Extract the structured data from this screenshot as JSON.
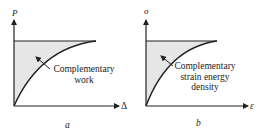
{
  "panels": [
    {
      "id": "a",
      "caption": "a",
      "y_axis_label": "P",
      "x_axis_label": "Δ",
      "annotation_lines": [
        "Complementary",
        "work"
      ]
    },
    {
      "id": "b",
      "caption": "b",
      "y_axis_label": "σ",
      "x_axis_label": "ε",
      "annotation_lines": [
        "Complementary",
        "strain energy",
        "density"
      ]
    }
  ],
  "colors": {
    "line": "#222222",
    "shade": "#e6e6e6",
    "background": "#ffffff"
  }
}
